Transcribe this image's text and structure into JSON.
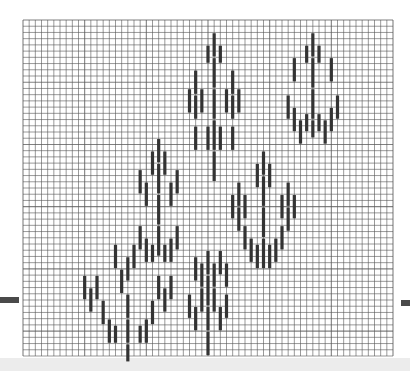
{
  "pattern": {
    "title": "",
    "grid": {
      "columns": 60,
      "rows": 54,
      "line_color": "#555555",
      "background": "#ffffff"
    },
    "stitch_color": "#333333",
    "stitch_orientation": "vertical",
    "motifs": [
      {
        "name": "motif-top-center",
        "stitches": [
          {
            "col": 31,
            "row": 2,
            "len": 4
          },
          {
            "col": 31,
            "row": 6,
            "len": 5
          },
          {
            "col": 31,
            "row": 11,
            "len": 5
          },
          {
            "col": 31,
            "row": 16,
            "len": 5
          },
          {
            "col": 31,
            "row": 21,
            "len": 5
          },
          {
            "col": 30,
            "row": 4,
            "len": 3
          },
          {
            "col": 32,
            "row": 4,
            "len": 3
          },
          {
            "col": 28,
            "row": 8,
            "len": 4
          },
          {
            "col": 28,
            "row": 12,
            "len": 4
          },
          {
            "col": 34,
            "row": 8,
            "len": 4
          },
          {
            "col": 34,
            "row": 12,
            "len": 4
          },
          {
            "col": 27,
            "row": 11,
            "len": 4
          },
          {
            "col": 29,
            "row": 11,
            "len": 4
          },
          {
            "col": 33,
            "row": 11,
            "len": 4
          },
          {
            "col": 35,
            "row": 11,
            "len": 4
          },
          {
            "col": 28,
            "row": 17,
            "len": 4
          },
          {
            "col": 34,
            "row": 17,
            "len": 4
          },
          {
            "col": 30,
            "row": 17,
            "len": 4
          },
          {
            "col": 32,
            "row": 17,
            "len": 4
          }
        ]
      },
      {
        "name": "motif-top-right",
        "stitches": [
          {
            "col": 47,
            "row": 2,
            "len": 4
          },
          {
            "col": 47,
            "row": 6,
            "len": 5
          },
          {
            "col": 47,
            "row": 11,
            "len": 5
          },
          {
            "col": 47,
            "row": 16,
            "len": 3
          },
          {
            "col": 46,
            "row": 4,
            "len": 3
          },
          {
            "col": 48,
            "row": 4,
            "len": 3
          },
          {
            "col": 44,
            "row": 6,
            "len": 4
          },
          {
            "col": 50,
            "row": 6,
            "len": 4
          },
          {
            "col": 43,
            "row": 12,
            "len": 4
          },
          {
            "col": 51,
            "row": 12,
            "len": 4
          },
          {
            "col": 44,
            "row": 14,
            "len": 4
          },
          {
            "col": 50,
            "row": 14,
            "len": 4
          },
          {
            "col": 45,
            "row": 16,
            "len": 4
          },
          {
            "col": 49,
            "row": 16,
            "len": 4
          },
          {
            "col": 46,
            "row": 15,
            "len": 3
          },
          {
            "col": 48,
            "row": 15,
            "len": 3
          }
        ]
      },
      {
        "name": "motif-middle-left",
        "stitches": [
          {
            "col": 22,
            "row": 19,
            "len": 4
          },
          {
            "col": 22,
            "row": 23,
            "len": 5
          },
          {
            "col": 22,
            "row": 28,
            "len": 5
          },
          {
            "col": 22,
            "row": 33,
            "len": 5
          },
          {
            "col": 21,
            "row": 21,
            "len": 4
          },
          {
            "col": 23,
            "row": 21,
            "len": 4
          },
          {
            "col": 19,
            "row": 24,
            "len": 4
          },
          {
            "col": 25,
            "row": 24,
            "len": 4
          },
          {
            "col": 20,
            "row": 26,
            "len": 4
          },
          {
            "col": 24,
            "row": 26,
            "len": 4
          },
          {
            "col": 19,
            "row": 33,
            "len": 4
          },
          {
            "col": 25,
            "row": 33,
            "len": 4
          },
          {
            "col": 20,
            "row": 35,
            "len": 4
          },
          {
            "col": 24,
            "row": 35,
            "len": 4
          },
          {
            "col": 21,
            "row": 36,
            "len": 3
          },
          {
            "col": 23,
            "row": 36,
            "len": 3
          }
        ]
      },
      {
        "name": "motif-middle-right",
        "stitches": [
          {
            "col": 39,
            "row": 21,
            "len": 4
          },
          {
            "col": 39,
            "row": 25,
            "len": 5
          },
          {
            "col": 39,
            "row": 30,
            "len": 5
          },
          {
            "col": 39,
            "row": 35,
            "len": 5
          },
          {
            "col": 38,
            "row": 23,
            "len": 4
          },
          {
            "col": 40,
            "row": 23,
            "len": 4
          },
          {
            "col": 35,
            "row": 26,
            "len": 4
          },
          {
            "col": 35,
            "row": 30,
            "len": 4
          },
          {
            "col": 43,
            "row": 26,
            "len": 4
          },
          {
            "col": 43,
            "row": 30,
            "len": 4
          },
          {
            "col": 34,
            "row": 28,
            "len": 4
          },
          {
            "col": 36,
            "row": 28,
            "len": 4
          },
          {
            "col": 42,
            "row": 28,
            "len": 4
          },
          {
            "col": 44,
            "row": 28,
            "len": 4
          },
          {
            "col": 36,
            "row": 33,
            "len": 4
          },
          {
            "col": 42,
            "row": 33,
            "len": 4
          },
          {
            "col": 37,
            "row": 35,
            "len": 4
          },
          {
            "col": 41,
            "row": 35,
            "len": 4
          },
          {
            "col": 38,
            "row": 36,
            "len": 4
          },
          {
            "col": 40,
            "row": 36,
            "len": 4
          }
        ]
      },
      {
        "name": "motif-bottom-left",
        "stitches": [
          {
            "col": 15,
            "row": 36,
            "len": 4
          },
          {
            "col": 18,
            "row": 36,
            "len": 4
          },
          {
            "col": 17,
            "row": 38,
            "len": 4
          },
          {
            "col": 17,
            "row": 44,
            "len": 4
          },
          {
            "col": 17,
            "row": 48,
            "len": 4
          },
          {
            "col": 17,
            "row": 52,
            "len": 3
          },
          {
            "col": 16,
            "row": 40,
            "len": 4
          },
          {
            "col": 10,
            "row": 41,
            "len": 4
          },
          {
            "col": 11,
            "row": 43,
            "len": 4
          },
          {
            "col": 12,
            "row": 41,
            "len": 4
          },
          {
            "col": 13,
            "row": 45,
            "len": 4
          },
          {
            "col": 14,
            "row": 48,
            "len": 4
          },
          {
            "col": 15,
            "row": 49,
            "len": 3
          },
          {
            "col": 22,
            "row": 41,
            "len": 4
          },
          {
            "col": 23,
            "row": 43,
            "len": 4
          },
          {
            "col": 24,
            "row": 41,
            "len": 4
          },
          {
            "col": 21,
            "row": 45,
            "len": 4
          },
          {
            "col": 20,
            "row": 48,
            "len": 4
          },
          {
            "col": 19,
            "row": 49,
            "len": 3
          }
        ]
      },
      {
        "name": "motif-bottom-center",
        "stitches": [
          {
            "col": 30,
            "row": 37,
            "len": 4
          },
          {
            "col": 30,
            "row": 41,
            "len": 5
          },
          {
            "col": 30,
            "row": 46,
            "len": 4
          },
          {
            "col": 30,
            "row": 50,
            "len": 4
          },
          {
            "col": 31,
            "row": 39,
            "len": 4
          },
          {
            "col": 31,
            "row": 43,
            "len": 4
          },
          {
            "col": 29,
            "row": 39,
            "len": 4
          },
          {
            "col": 29,
            "row": 43,
            "len": 4
          },
          {
            "col": 32,
            "row": 37,
            "len": 4
          },
          {
            "col": 33,
            "row": 39,
            "len": 4
          },
          {
            "col": 28,
            "row": 38,
            "len": 4
          },
          {
            "col": 27,
            "row": 44,
            "len": 4
          },
          {
            "col": 28,
            "row": 46,
            "len": 4
          },
          {
            "col": 33,
            "row": 44,
            "len": 4
          },
          {
            "col": 32,
            "row": 46,
            "len": 4
          }
        ]
      }
    ]
  }
}
